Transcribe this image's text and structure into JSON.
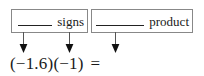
{
  "diagram": {
    "type": "annotated-math-expression",
    "boxes": [
      {
        "id": "signs",
        "blank_label": "blank-underscore-line",
        "word": "signs",
        "points_to": [
          "first-negative-sign",
          "second-negative-sign"
        ]
      },
      {
        "id": "product",
        "blank_label": "blank-underscore-line",
        "word": "product",
        "points_to": [
          "result-after-equals"
        ]
      }
    ],
    "arrows": [
      {
        "id": "arrow-to-first-sign",
        "glyph": "down-arrow",
        "target": "(−1.6) negative sign"
      },
      {
        "id": "arrow-to-second-sign",
        "glyph": "down-arrow",
        "target": "(−1) negative sign"
      },
      {
        "id": "arrow-to-product",
        "glyph": "down-arrow",
        "target": "right side of equals sign"
      }
    ],
    "expression": {
      "full": "(−1.6)(−1) =",
      "first_factor": "(−1.6)",
      "second_factor": "(−1)",
      "equals": "="
    },
    "colors": {
      "box_border": "#888888",
      "text": "#1a1a1a",
      "blank_rule": "#222222",
      "arrow": "#1a1a1a",
      "background": "#ffffff"
    }
  }
}
